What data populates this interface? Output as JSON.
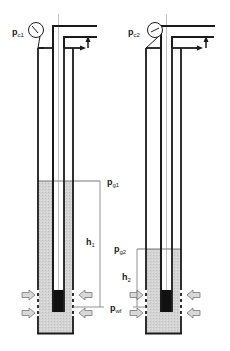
{
  "diagram": {
    "type": "well schematic comparison",
    "colors": {
      "line": "#1a1a1a",
      "liquid": "#d0d0d0",
      "packer": "#111111",
      "dimension": "#777777",
      "arrow_fill": "#d8d8d8",
      "background": "#ffffff"
    },
    "wells": [
      {
        "id": "well-1",
        "gauge": {
          "symbol": "p",
          "subscript": "c1"
        },
        "liquid_level": {
          "symbol": "p",
          "subscript": "g1"
        },
        "height": {
          "symbol": "h",
          "subscript": "1"
        },
        "bottom_pressure": {
          "symbol": "p",
          "subscript": "wf"
        }
      },
      {
        "id": "well-2",
        "gauge": {
          "symbol": "p",
          "subscript": "c2"
        },
        "liquid_level": {
          "symbol": "p",
          "subscript": "g2"
        },
        "height": {
          "symbol": "h",
          "subscript": "2"
        }
      }
    ]
  }
}
